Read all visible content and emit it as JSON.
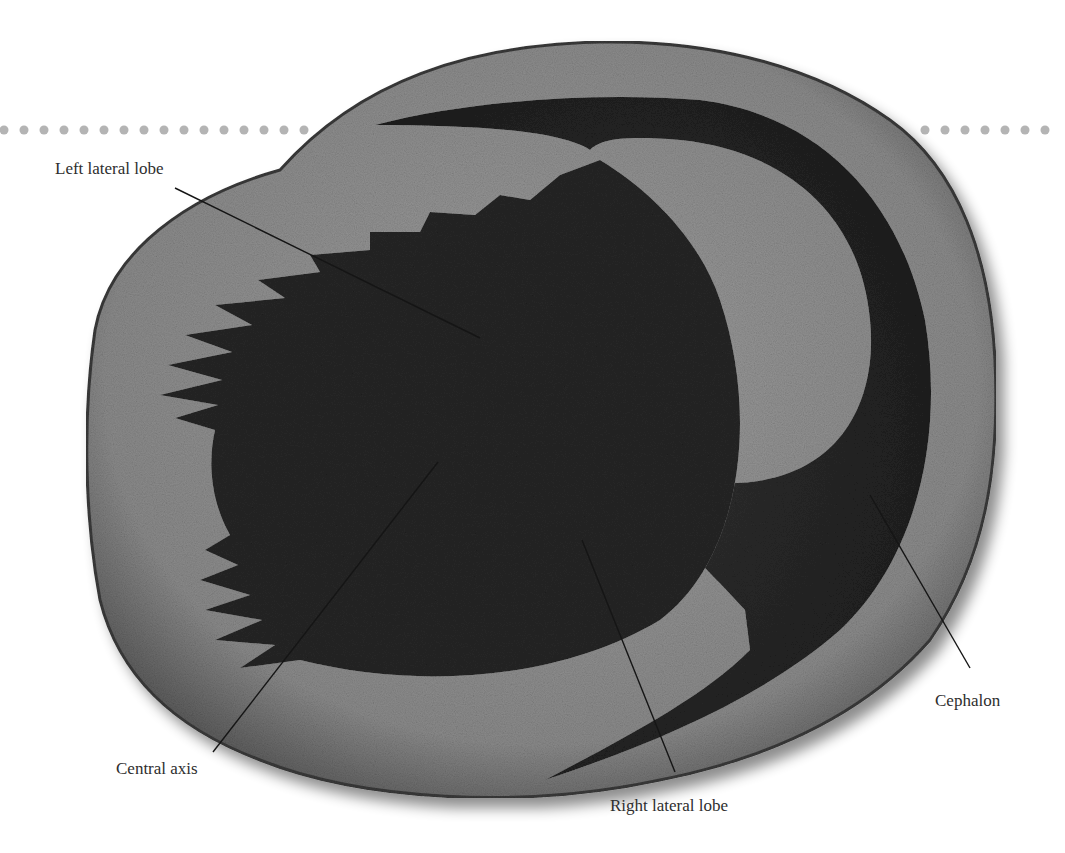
{
  "figure": {
    "labels": [
      {
        "id": "left-lateral-lobe",
        "text": "Left lateral lobe",
        "x": 55,
        "y": 160,
        "line": [
          175,
          188,
          480,
          338
        ]
      },
      {
        "id": "central-axis",
        "text": "Central axis",
        "x": 116,
        "y": 760,
        "line": [
          213,
          752,
          438,
          462
        ]
      },
      {
        "id": "right-lateral-lobe",
        "text": "Right lateral lobe",
        "x": 610,
        "y": 797,
        "line": [
          675,
          772,
          582,
          540
        ]
      },
      {
        "id": "cephalon",
        "text": "Cephalon",
        "x": 935,
        "y": 692,
        "line": [
          970,
          668,
          870,
          495
        ]
      }
    ],
    "colors": {
      "background": "#ffffff",
      "matrix_rock": "#8e8e8e",
      "fossil_body": "#2a2a2a",
      "dots": "#b4b4b4",
      "label_text": "#2e2e2e",
      "leader_line": "#1a1a1a"
    },
    "dotted_rule": {
      "y": 130,
      "spacing": 20,
      "left_start": 4,
      "left_end": 310,
      "right_start": 925,
      "right_end": 1062
    }
  }
}
